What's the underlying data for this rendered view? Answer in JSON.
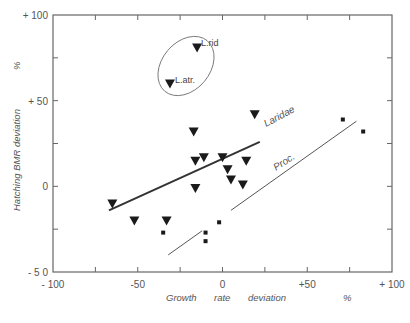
{
  "chart_data": {
    "type": "scatter",
    "title": "",
    "xlabel": "Growth rate deviation %",
    "ylabel": "Hatching BMR deviation %",
    "xlim": [
      -100,
      100
    ],
    "ylim": [
      -50,
      100
    ],
    "grid": false,
    "x_ticks": [
      -100,
      -75,
      -50,
      -25,
      0,
      25,
      50,
      75,
      100
    ],
    "x_tick_labels": [
      {
        "value": -100,
        "label": "- 100"
      },
      {
        "value": -50,
        "label": "-50"
      },
      {
        "value": 0,
        "label": "0"
      },
      {
        "value": 50,
        "label": "+50"
      },
      {
        "value": 100,
        "label": "+ 100"
      }
    ],
    "y_ticks": [
      -50,
      -25,
      0,
      25,
      50,
      75,
      100
    ],
    "y_tick_labels": [
      {
        "value": 100,
        "label": "+ 100"
      },
      {
        "value": 50,
        "label": "+ 50"
      },
      {
        "value": 0,
        "label": "0"
      },
      {
        "value": -50,
        "label": "- 5 0"
      }
    ],
    "series": [
      {
        "name": "Laridae",
        "marker": "triangle-down",
        "points": [
          {
            "x": -65,
            "y": -10
          },
          {
            "x": -52,
            "y": -20
          },
          {
            "x": -33,
            "y": -20
          },
          {
            "x": -17,
            "y": 32
          },
          {
            "x": -16,
            "y": 15
          },
          {
            "x": -11,
            "y": 17
          },
          {
            "x": -16,
            "y": -1
          },
          {
            "x": 0,
            "y": 17
          },
          {
            "x": 3,
            "y": 10
          },
          {
            "x": 5,
            "y": 4
          },
          {
            "x": 12,
            "y": 1
          },
          {
            "x": 14,
            "y": 15
          },
          {
            "x": 19,
            "y": 42
          },
          {
            "x": -15,
            "y": 81,
            "label": "L.rid"
          },
          {
            "x": -31,
            "y": 60,
            "label": "L.atr."
          }
        ],
        "regression_line": {
          "x1": -67,
          "y1": -14,
          "x2": 22,
          "y2": 26,
          "label": "Laridae"
        }
      },
      {
        "name": "Proc.",
        "marker": "square",
        "points": [
          {
            "x": -35,
            "y": -27
          },
          {
            "x": -10,
            "y": -27
          },
          {
            "x": -10,
            "y": -32
          },
          {
            "x": -2,
            "y": -21
          },
          {
            "x": 71,
            "y": 39
          },
          {
            "x": 83,
            "y": 32
          }
        ],
        "regression_line": {
          "x1": -32,
          "y1": -40,
          "x2": 79,
          "y2": 38,
          "label": "Proc.",
          "style": "thin, broken"
        }
      }
    ],
    "annotations": [
      {
        "type": "ellipse",
        "encloses": [
          "L.rid",
          "L.atr."
        ]
      },
      {
        "type": "text",
        "text": "Laridae"
      },
      {
        "type": "text",
        "text": "Proc."
      }
    ]
  },
  "labels": {
    "x_axis_words": [
      "Growth",
      "rate",
      "deviation",
      "%"
    ],
    "y_axis_text": "Hatching   BMR  deviation",
    "y_axis_unit": "%",
    "line_laridae": "Laridae",
    "line_proc": "Proc.",
    "point_lrid": "L.rid",
    "point_latr": "L.atr."
  }
}
